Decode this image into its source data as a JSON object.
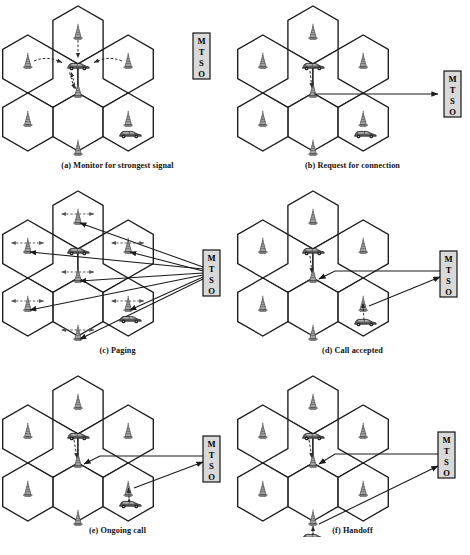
{
  "figure": {
    "colors": {
      "cell_stroke": "#1a1a1a",
      "cell_fill": "#ffffff",
      "mtso_fill": "#d9d9d9",
      "mtso_stroke": "#000000",
      "arrow": "#1a1a1a",
      "dashed_arrow": "#333333",
      "tower": "#6e6e6e",
      "car_body": "#555555",
      "caption": "#111111",
      "page_bg": "#ffffff"
    },
    "mtso": {
      "name": "MTSO",
      "letters": [
        "M",
        "T",
        "S",
        "O"
      ],
      "expansion": "Mobile Telecommunications Switching Office"
    },
    "icons": {
      "tower": "cell-tower-icon",
      "car": "mobile-unit-car-icon",
      "signal_arrow": "signal-arrow-icon",
      "link_arrow": "link-arrow-icon"
    },
    "panels": [
      {
        "id": "a",
        "letter": "(a)",
        "title": "Monitor for strongest signal",
        "caption": "(a) Monitor for strongest signal",
        "mtso_visible": true,
        "mtso_connected": false,
        "cars": 2,
        "towers": 7,
        "description": "Mobile unit scans for the strongest base station signal; dashed signal arrows from surrounding towers converge on the car."
      },
      {
        "id": "b",
        "letter": "(b)",
        "title": "Request for connection",
        "caption": "(b) Request for connection",
        "mtso_visible": true,
        "mtso_connected": true,
        "cars": 2,
        "towers": 7,
        "description": "The serving base station forwards the mobile unit's connection request to the MTSO."
      },
      {
        "id": "c",
        "letter": "(c)",
        "title": "Paging",
        "caption": "(c) Paging",
        "mtso_visible": true,
        "mtso_connected": true,
        "cars": 2,
        "towers": 7,
        "description": "The MTSO pages all base stations, which broadcast the paging message into every cell."
      },
      {
        "id": "d",
        "letter": "(d)",
        "title": "Call accepted",
        "caption": "(d) Call accepted",
        "mtso_visible": true,
        "mtso_connected": true,
        "cars": 2,
        "towers": 7,
        "description": "The called mobile unit answers; the MTSO sets up a circuit between the two base stations."
      },
      {
        "id": "e",
        "letter": "(e)",
        "title": "Ongoing call",
        "caption": "(e) Ongoing call",
        "mtso_visible": true,
        "mtso_connected": true,
        "cars": 2,
        "towers": 7,
        "description": "Voice traffic flows between the two mobile units through their base stations and the MTSO."
      },
      {
        "id": "f",
        "letter": "(f)",
        "title": "Handoff",
        "caption": "(f) Handoff",
        "mtso_visible": true,
        "mtso_connected": true,
        "cars": 2,
        "towers": 7,
        "description": "A mobile unit moves into a new cell; the MTSO hands the call off to the new base station."
      }
    ]
  }
}
